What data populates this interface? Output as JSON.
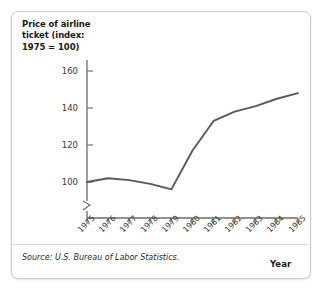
{
  "figure": {
    "title": "Price of airline ticket (index: 1975 = 100)",
    "title_line1": "Price of airline",
    "title_line2": "ticket (index:",
    "title_line3": "1975 = 100)",
    "x_axis_name": "Year",
    "source": "Source: U.S. Bureau of Labor Statistics.",
    "line_color": "#595959",
    "axis_color": "#6b6b6b",
    "text_color": "#1a1a1a",
    "background": "#ffffff",
    "border_color": "#c9c9c9"
  },
  "chart_data": {
    "type": "line",
    "title": "Price of airline ticket (index: 1975 = 100)",
    "xlabel": "Year",
    "ylabel": "Price of airline ticket (index: 1975 = 100)",
    "categories": [
      "1975",
      "1976",
      "1977",
      "1978",
      "1979",
      "1980",
      "1981",
      "1982",
      "1983",
      "1984",
      "1985"
    ],
    "values": [
      100,
      102,
      101,
      99,
      96,
      117,
      133,
      138,
      141,
      145,
      148
    ],
    "y_ticks": [
      100,
      120,
      140,
      160
    ],
    "y_tick_labels": [
      "100",
      "120",
      "140",
      "160"
    ],
    "ylim": [
      92,
      168
    ],
    "axis_break": true,
    "axis_break_note": "y-axis broken below 100",
    "grid": false,
    "legend": null,
    "series": [
      {
        "name": "Price of airline ticket (index: 1975 = 100)",
        "values": [
          100,
          102,
          101,
          99,
          96,
          117,
          133,
          138,
          141,
          145,
          148
        ]
      }
    ]
  }
}
